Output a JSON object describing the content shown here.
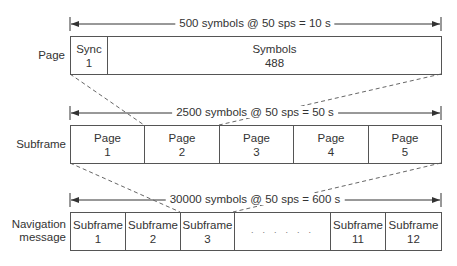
{
  "diagram": {
    "type": "frame-hierarchy",
    "rows": [
      {
        "id": "page",
        "label": "Page",
        "dimension": "500 symbols @ 50 sps = 10 s",
        "cells": [
          {
            "title": "Sync",
            "value": "1"
          },
          {
            "title": "Symbols",
            "value": "488"
          }
        ]
      },
      {
        "id": "subframe",
        "label": "Subframe",
        "dimension": "2500 symbols @ 50 sps = 50 s",
        "cells": [
          {
            "title": "Page",
            "value": "1"
          },
          {
            "title": "Page",
            "value": "2"
          },
          {
            "title": "Page",
            "value": "3"
          },
          {
            "title": "Page",
            "value": "4"
          },
          {
            "title": "Page",
            "value": "5"
          }
        ]
      },
      {
        "id": "navigation",
        "label_line1": "Navigation",
        "label_line2": "message",
        "dimension": "30000 symbols @ 50 sps = 600 s",
        "cells": [
          {
            "title": "Subframe",
            "value": "1"
          },
          {
            "title": "Subframe",
            "value": "2"
          },
          {
            "title": "Subframe",
            "value": "3"
          },
          {
            "title": "",
            "value": "· · · · · ·"
          },
          {
            "title": "Subframe",
            "value": "11"
          },
          {
            "title": "Subframe",
            "value": "12"
          }
        ]
      }
    ],
    "colors": {
      "line": "#555555",
      "text": "#333333"
    }
  }
}
